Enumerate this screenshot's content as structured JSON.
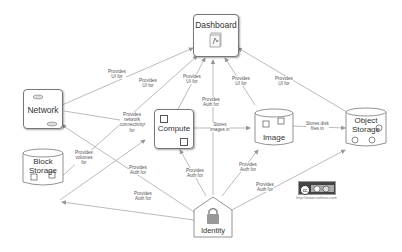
{
  "nodes": {
    "dashboard": "Dashboard",
    "network": "Network",
    "block_storage_1": "Block",
    "block_storage_2": "Storage",
    "compute": "Compute",
    "image": "Image",
    "object_storage_1": "Object",
    "object_storage_2": "Storage",
    "identity": "Identity"
  },
  "edges": [
    {
      "from": "Network",
      "to": "Dashboard",
      "label": [
        "Provides",
        "UI for"
      ]
    },
    {
      "from": "Block Storage",
      "to": "Dashboard",
      "label": [
        "Provides",
        "UI for"
      ]
    },
    {
      "from": "Compute",
      "to": "Dashboard",
      "label": [
        "Provides",
        "UI for"
      ]
    },
    {
      "from": "Identity",
      "to": "Dashboard",
      "label": [
        "Provides",
        "Auth for"
      ]
    },
    {
      "from": "Image",
      "to": "Dashboard",
      "label": [
        "Provides",
        "UI for"
      ]
    },
    {
      "from": "Object Storage",
      "to": "Dashboard",
      "label": [
        "Provides",
        "UI for"
      ]
    },
    {
      "from": "Network",
      "to": "Compute",
      "label": [
        "Provides",
        "network",
        "connectivity",
        "for"
      ]
    },
    {
      "from": "Block Storage",
      "to": "Compute",
      "label": [
        "Provides",
        "volumes",
        "for"
      ]
    },
    {
      "from": "Compute",
      "to": "Image",
      "label": [
        "Stores",
        "images in"
      ]
    },
    {
      "from": "Image",
      "to": "Object Storage",
      "label": [
        "Stores disk",
        "files in"
      ]
    },
    {
      "from": "Identity",
      "to": "Network",
      "label": [
        "Provides",
        "Auth for"
      ]
    },
    {
      "from": "Identity",
      "to": "Block Storage",
      "label": [
        "Provides",
        "Auth for"
      ]
    },
    {
      "from": "Identity",
      "to": "Compute",
      "label": [
        "Provides",
        "Auth for"
      ]
    },
    {
      "from": "Identity",
      "to": "Image",
      "label": [
        "Provides",
        "Auth for"
      ]
    },
    {
      "from": "Identity",
      "to": "Object Storage",
      "label": [
        "Provides",
        "Auth for"
      ]
    }
  ],
  "labels": {
    "l1": [
      "Provides",
      "UI for"
    ],
    "l2": [
      "Provides",
      "UI for"
    ],
    "l3": [
      "Provides",
      "UI for"
    ],
    "l4": [
      "Provides",
      "Auth for"
    ],
    "l5": [
      "Provides",
      "UI for"
    ],
    "l6": [
      "Provides",
      "UI for"
    ],
    "l7": [
      "Provides",
      "network",
      "connectivity",
      "for"
    ],
    "l8": [
      "Provides",
      "volumes",
      "for"
    ],
    "l9": [
      "Stores",
      "images in"
    ],
    "l10": [
      "Stores disk",
      "files in"
    ],
    "l11": [
      "Provides",
      "Auth for"
    ],
    "l12": [
      "Provides",
      "Auth for"
    ],
    "l13": [
      "Provides",
      "Auth for"
    ],
    "l14": [
      "Provides",
      "Auth for"
    ],
    "l15": [
      "Provides",
      "Auth for"
    ]
  },
  "license": {
    "badge": "cc by sa",
    "url": "http://www.solinea.com"
  }
}
